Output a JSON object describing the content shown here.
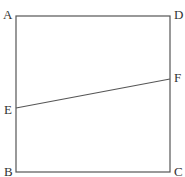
{
  "diagram": {
    "type": "geometry",
    "shape": "square",
    "vertices": {
      "A": {
        "label": "A",
        "x": 16,
        "y": 16
      },
      "D": {
        "label": "D",
        "x": 170,
        "y": 16
      },
      "C": {
        "label": "C",
        "x": 170,
        "y": 172
      },
      "B": {
        "label": "B",
        "x": 16,
        "y": 172
      }
    },
    "points": {
      "E": {
        "label": "E",
        "x": 16,
        "y": 108,
        "on": "AB"
      },
      "F": {
        "label": "F",
        "x": 170,
        "y": 79,
        "on": "DC"
      }
    },
    "segments": [
      "AD",
      "DC",
      "CB",
      "BA",
      "EF"
    ],
    "colors": {
      "line": "#555555",
      "text": "#333333",
      "background": "#ffffff"
    }
  }
}
